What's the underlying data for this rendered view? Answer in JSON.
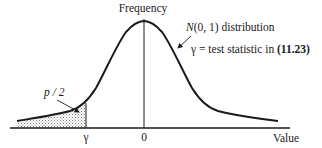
{
  "figure": {
    "title": "Frequency",
    "curve_label_prefix": "N",
    "curve_label_suffix": "(0, 1) distribution",
    "gamma_label_symbol": "γ",
    "gamma_label_text": " = test statistic in ",
    "gamma_label_ref": "(11.23)",
    "tail_label": "p / 2",
    "x_ticks": [
      {
        "label": "γ"
      },
      {
        "label": "0"
      }
    ],
    "x_axis_label": "Value",
    "colors": {
      "ink": "#1a1a1a",
      "shade": "#9a9a9a",
      "background": "#ffffff"
    }
  }
}
